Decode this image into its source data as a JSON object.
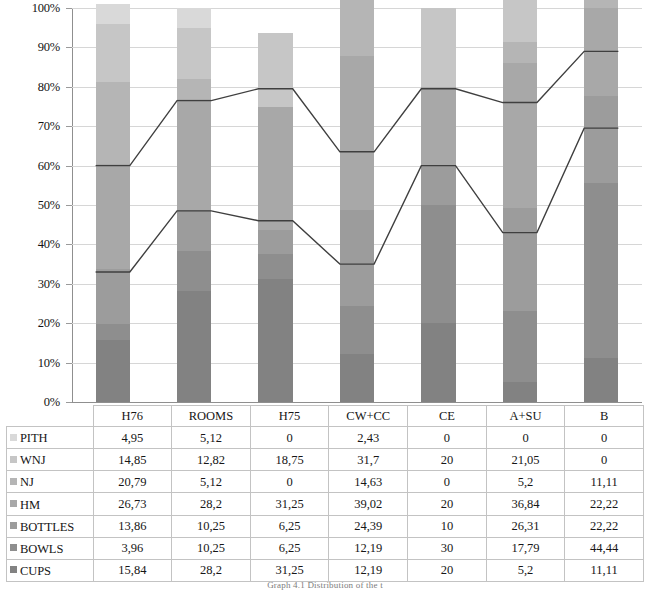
{
  "chart_data": {
    "type": "bar",
    "stacked": true,
    "normalized": "100%",
    "title": "",
    "subtitle": "",
    "xlabel": "",
    "ylabel": "",
    "ylim": [
      0,
      100
    ],
    "grid": true,
    "legend_position": "table-row-headers",
    "categories": [
      "H76",
      "ROOMS",
      "H75",
      "CW+CC",
      "CE",
      "A+SU",
      "B"
    ],
    "y_ticks": [
      "0%",
      "10%",
      "20%",
      "30%",
      "40%",
      "50%",
      "60%",
      "70%",
      "80%",
      "90%",
      "100%"
    ],
    "y_tick_values": [
      0,
      10,
      20,
      30,
      40,
      50,
      60,
      70,
      80,
      90,
      100
    ],
    "series": [
      {
        "name": "PITH",
        "color": "#d9d9d9",
        "values": [
          4.95,
          5.12,
          0,
          2.43,
          0,
          0,
          0
        ],
        "labels": [
          "4,95",
          "5,12",
          "0",
          "2,43",
          "0",
          "0",
          "0"
        ]
      },
      {
        "name": "WNJ",
        "color": "#c6c6c6",
        "values": [
          14.85,
          12.82,
          18.75,
          31.7,
          20,
          21.05,
          0
        ],
        "labels": [
          "14,85",
          "12,82",
          "18,75",
          "31,7",
          "20",
          "21,05",
          "0"
        ]
      },
      {
        "name": "NJ",
        "color": "#b5b5b5",
        "values": [
          20.79,
          5.12,
          0,
          14.63,
          0,
          5.2,
          11.11
        ],
        "labels": [
          "20,79",
          "5,12",
          "0",
          "14,63",
          "0",
          "5,2",
          "11,11"
        ]
      },
      {
        "name": "HM",
        "color": "#a8a8a8",
        "values": [
          26.73,
          28.2,
          31.25,
          39.02,
          20,
          36.84,
          22.22
        ],
        "labels": [
          "26,73",
          "28,2",
          "31,25",
          "39,02",
          "20",
          "36,84",
          "22,22"
        ]
      },
      {
        "name": "BOTTLES",
        "color": "#9c9c9c",
        "values": [
          13.86,
          10.25,
          6.25,
          24.39,
          10,
          26.31,
          22.22
        ],
        "labels": [
          "13,86",
          "10,25",
          "6,25",
          "24,39",
          "10",
          "26,31",
          "22,22"
        ]
      },
      {
        "name": "BOWLS",
        "color": "#8e8e8e",
        "values": [
          3.96,
          10.25,
          6.25,
          12.19,
          30,
          17.79,
          44.44
        ],
        "labels": [
          "3,96",
          "10,25",
          "6,25",
          "12,19",
          "30",
          "17,79",
          "44,44"
        ]
      },
      {
        "name": "CUPS",
        "color": "#828282",
        "values": [
          15.84,
          28.2,
          31.25,
          12.19,
          20,
          5.2,
          11.11
        ],
        "labels": [
          "15,84",
          "28,2",
          "31,25",
          "12,19",
          "20",
          "5,2",
          "11,11"
        ]
      }
    ],
    "overlay_lines": [
      {
        "name": "upper-cumulative-line",
        "color": "#3f3f3f",
        "values": [
          60.0,
          76.5,
          79.5,
          63.5,
          79.5,
          76.0,
          89.0
        ]
      },
      {
        "name": "lower-cumulative-line",
        "color": "#3f3f3f",
        "values": [
          33.0,
          48.5,
          46.0,
          35.0,
          60.0,
          43.0,
          69.5
        ]
      }
    ]
  },
  "table": {
    "corner_header": "",
    "column_headers": [
      "H76",
      "ROOMS",
      "H75",
      "CW+CC",
      "CE",
      "A+SU",
      "B"
    ],
    "rows": [
      {
        "label": "PITH",
        "swatch": "#d9d9d9",
        "cells": [
          "4,95",
          "5,12",
          "0",
          "2,43",
          "0",
          "0",
          "0"
        ]
      },
      {
        "label": "WNJ",
        "swatch": "#c6c6c6",
        "cells": [
          "14,85",
          "12,82",
          "18,75",
          "31,7",
          "20",
          "21,05",
          "0"
        ]
      },
      {
        "label": "NJ",
        "swatch": "#b5b5b5",
        "cells": [
          "20,79",
          "5,12",
          "0",
          "14,63",
          "0",
          "5,2",
          "11,11"
        ]
      },
      {
        "label": "HM",
        "swatch": "#a8a8a8",
        "cells": [
          "26,73",
          "28,2",
          "31,25",
          "39,02",
          "20",
          "36,84",
          "22,22"
        ]
      },
      {
        "label": "BOTTLES",
        "swatch": "#9c9c9c",
        "cells": [
          "13,86",
          "10,25",
          "6,25",
          "24,39",
          "10",
          "26,31",
          "22,22"
        ]
      },
      {
        "label": "BOWLS",
        "swatch": "#8e8e8e",
        "cells": [
          "3,96",
          "10,25",
          "6,25",
          "12,19",
          "30",
          "17,79",
          "44,44"
        ]
      },
      {
        "label": "CUPS",
        "swatch": "#828282",
        "cells": [
          "15,84",
          "28,2",
          "31,25",
          "12,19",
          "20",
          "5,2",
          "11,11"
        ]
      }
    ]
  },
  "caption": "Graph 4.1 Distribution of the t"
}
